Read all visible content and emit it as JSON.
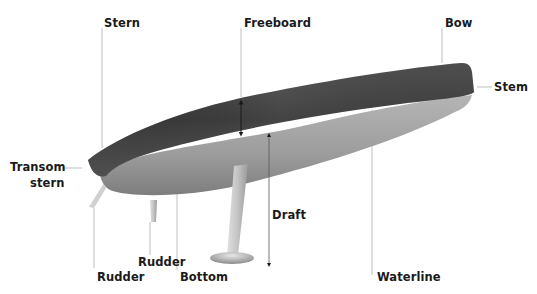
{
  "diagram": {
    "colors": {
      "topsides_dark": "#3a3a3a",
      "topsides_mid": "#6e6e6e",
      "bottom_light": "#c8c8c8",
      "bottom_mid": "#9a9a9a",
      "leader_line": "#b0b0b0",
      "arrow": "#1a1a1a",
      "label_text": "#1a1a1a"
    },
    "labels": {
      "stern": "Stern",
      "freeboard": "Freeboard",
      "bow": "Bow",
      "stem": "Stem",
      "transom_line1": "Transom",
      "transom_line2": "stern",
      "draft": "Draft",
      "rudder_inner": "Rudder",
      "rudder_outer": "Rudder",
      "bottom": "Bottom",
      "waterline": "Waterline"
    }
  }
}
